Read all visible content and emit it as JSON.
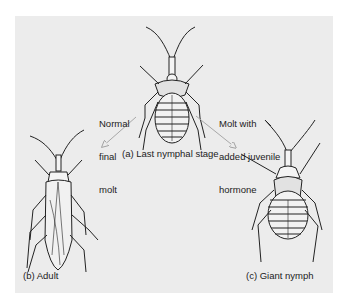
{
  "figure": {
    "background_color": "#ececec",
    "line_color": "#222222",
    "arrow_color": "#a8a8a8",
    "stages": [
      {
        "id": "a",
        "caption": "(a) Last nymphal stage"
      },
      {
        "id": "b",
        "caption": "(b) Adult"
      },
      {
        "id": "c",
        "caption": "(c) Giant nymph"
      }
    ],
    "transitions": [
      {
        "from": "a",
        "to": "b",
        "label_lines": [
          "Normal",
          "final",
          "molt"
        ]
      },
      {
        "from": "a",
        "to": "c",
        "label_lines": [
          "Molt with",
          "added juvenile",
          "hormone"
        ]
      }
    ]
  }
}
